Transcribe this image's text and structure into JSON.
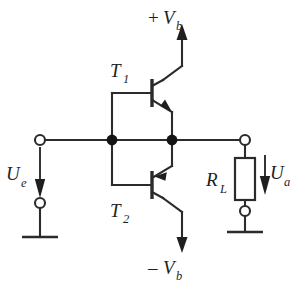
{
  "diagram": {
    "background_color": "#ffffff",
    "line_color": "#2b2b2b",
    "text_color": "#1f1f1f"
  },
  "supplies": {
    "positive": {
      "sign": "+",
      "symbol": "V",
      "subscript": "b",
      "arrow": "up"
    },
    "negative": {
      "sign": "–",
      "symbol": "V",
      "subscript": "b",
      "arrow": "down"
    }
  },
  "transistors": [
    {
      "id": "T1",
      "symbol": "T",
      "subscript": "1",
      "type": "npn",
      "role": "upper-emitter-follower"
    },
    {
      "id": "T2",
      "symbol": "T",
      "subscript": "2",
      "type": "pnp",
      "role": "lower-emitter-follower"
    }
  ],
  "input": {
    "label_symbol": "U",
    "label_subscript": "e",
    "arrow": "down",
    "terminal_top": "open-circle",
    "terminal_bottom": "open-circle",
    "ground": "ground-symbol"
  },
  "output": {
    "label_symbol": "U",
    "label_subscript": "a",
    "arrow": "down",
    "terminal_top": "open-circle",
    "terminal_bottom": "open-circle",
    "ground": "ground-symbol"
  },
  "load": {
    "symbol": "R",
    "subscript": "L",
    "component": "resistor"
  },
  "nodes": {
    "base_node": "input-base-junction",
    "output_node": "emitter-output-junction"
  }
}
